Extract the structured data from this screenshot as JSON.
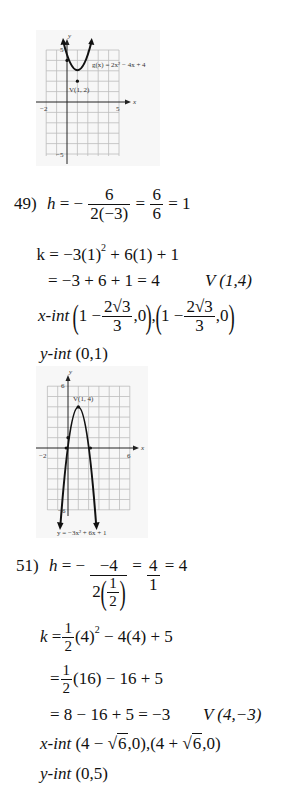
{
  "graph1": {
    "equation_label": "g(x) = 2x² − 4x + 4",
    "vertex_label": "V(1, 2)",
    "x_axis_label": "x",
    "y_axis_label": "y",
    "x_min_tick": "−2",
    "x_max_tick": "5",
    "y_max_tick": "5",
    "y_min_tick": "−5"
  },
  "problem49": {
    "number": "49)",
    "h_var": "h",
    "h_eq": "= −",
    "h_num": "6",
    "h_den": "2(−3)",
    "h_eq2": "=",
    "h_num2": "6",
    "h_den2": "6",
    "h_result": "= 1",
    "k_line1": "k = −3(1)",
    "k_line1_exp": "2",
    "k_line1_rest": " + 6(1) + 1",
    "k_line2": "= −3 + 6 + 1 = 4",
    "vertex": "V (1,4)",
    "xint_label": "x-int",
    "xint_1_pre": "1 −",
    "xint_1_num": "2√3",
    "xint_1_den": "3",
    "xint_1_post": ",0",
    "xint_2_pre": "1 −",
    "xint_2_num": "2√3",
    "xint_2_den": "3",
    "xint_2_post": ",0",
    "yint_label": "y-int",
    "yint_value": "(0,1)"
  },
  "graph2": {
    "equation_label": "y = −3x² + 6x + 1",
    "vertex_label": "V(1, 4)",
    "x_axis_label": "x",
    "y_axis_label": "y",
    "x_min_tick": "−2",
    "x_max_tick": "6",
    "y_max_tick": "6",
    "y_min_tick": "−6"
  },
  "problem51": {
    "number": "51)",
    "h_var": "h",
    "h_eq": "= −",
    "h_num": "−4",
    "h_den_pre": "2",
    "h_den_num": "1",
    "h_den_den": "2",
    "h_eq2": "=",
    "h_num2": "4",
    "h_den2": "1",
    "h_result": "= 4",
    "k_var": "k",
    "k_eq": "=",
    "k_half_num": "1",
    "k_half_den": "2",
    "k_line1_a": "(4)",
    "k_line1_exp": "2",
    "k_line1_rest": " − 4(4) + 5",
    "k_line2_eq": "=",
    "k_line2_rest": "(16) − 16 + 5",
    "k_line3": "= 8 − 16 + 5 = −3",
    "vertex": "V (4,−3)",
    "xint_label": "x-int",
    "xint_value_1_pre": "(4 − ",
    "xint_value_1_rad": "6",
    "xint_value_1_post": ",0),",
    "xint_value_2_pre": "(4 + ",
    "xint_value_2_rad": "6",
    "xint_value_2_post": ",0)",
    "yint_label": "y-int",
    "yint_value": "(0,5)"
  }
}
